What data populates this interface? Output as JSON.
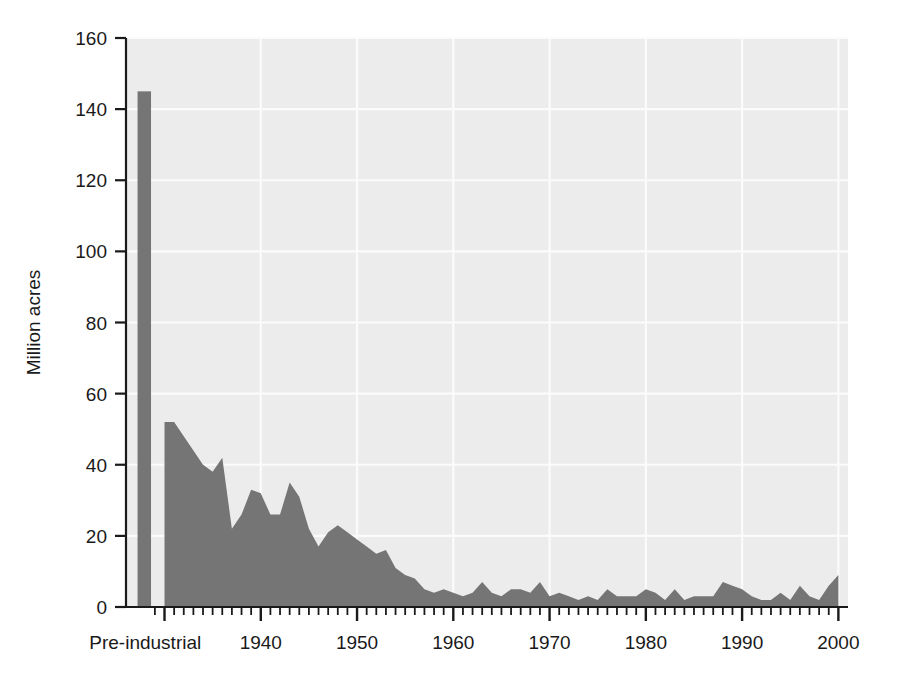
{
  "chart_data": {
    "type": "area",
    "title": "",
    "xlabel": "",
    "ylabel": "Million acres",
    "ylim": [
      0,
      160
    ],
    "xlim": [
      1926,
      2001
    ],
    "grid": true,
    "legend": false,
    "legend_position": "none",
    "colors": {
      "fill": "#757575",
      "plot_background": "#ececec",
      "gridline": "#fbfbfb",
      "axis": "#1a1a1a",
      "page_background": "#ffffff"
    },
    "ytick_labels": [
      "0",
      "20",
      "40",
      "60",
      "80",
      "100",
      "120",
      "140",
      "160"
    ],
    "ytick_values": [
      0,
      20,
      40,
      60,
      80,
      100,
      120,
      140,
      160
    ],
    "xtick_labels": [
      "Pre-industrial",
      "1940",
      "1950",
      "1960",
      "1970",
      "1980",
      "1990",
      "2000"
    ],
    "xtick_values": [
      1928,
      1940,
      1950,
      1960,
      1970,
      1980,
      1990,
      2000
    ],
    "minor_xtick_interval": 1,
    "preindustrial_bar": {
      "label": "Pre-industrial",
      "value": 145,
      "x_start": 1927.2,
      "x_end": 1928.6
    },
    "x": [
      1930,
      1931,
      1932,
      1933,
      1934,
      1935,
      1936,
      1937,
      1938,
      1939,
      1940,
      1941,
      1942,
      1943,
      1944,
      1945,
      1946,
      1947,
      1948,
      1949,
      1950,
      1951,
      1952,
      1953,
      1954,
      1955,
      1956,
      1957,
      1958,
      1959,
      1960,
      1961,
      1962,
      1963,
      1964,
      1965,
      1966,
      1967,
      1968,
      1969,
      1970,
      1971,
      1972,
      1973,
      1974,
      1975,
      1976,
      1977,
      1978,
      1979,
      1980,
      1981,
      1982,
      1983,
      1984,
      1985,
      1986,
      1987,
      1988,
      1989,
      1990,
      1991,
      1992,
      1993,
      1994,
      1995,
      1996,
      1997,
      1998,
      1999,
      2000
    ],
    "values": [
      52,
      52,
      48,
      44,
      40,
      38,
      42,
      22,
      26,
      33,
      32,
      26,
      26,
      35,
      31,
      22,
      17,
      21,
      23,
      21,
      19,
      17,
      15,
      16,
      11,
      9,
      8,
      5,
      4,
      5,
      4,
      3,
      4,
      7,
      4,
      3,
      5,
      5,
      4,
      7,
      3,
      4,
      3,
      2,
      3,
      2,
      5,
      3,
      3,
      3,
      5,
      4,
      2,
      5,
      2,
      3,
      3,
      3,
      7,
      6,
      5,
      3,
      2,
      2,
      4,
      2,
      6,
      3,
      2,
      6,
      9
    ]
  },
  "axes": {
    "y_axis_title": "Million acres",
    "y_ticks": [
      {
        "label": "160",
        "value": 160
      },
      {
        "label": "140",
        "value": 140
      },
      {
        "label": "120",
        "value": 120
      },
      {
        "label": "100",
        "value": 100
      },
      {
        "label": "80",
        "value": 80
      },
      {
        "label": "60",
        "value": 60
      },
      {
        "label": "40",
        "value": 40
      },
      {
        "label": "20",
        "value": 20
      },
      {
        "label": "0",
        "value": 0
      }
    ],
    "x_ticks": [
      {
        "label": "Pre-industrial",
        "value": 1928
      },
      {
        "label": "1940",
        "value": 1940
      },
      {
        "label": "1950",
        "value": 1950
      },
      {
        "label": "1960",
        "value": 1960
      },
      {
        "label": "1970",
        "value": 1970
      },
      {
        "label": "1980",
        "value": 1980
      },
      {
        "label": "1990",
        "value": 1990
      },
      {
        "label": "2000",
        "value": 2000
      }
    ]
  }
}
